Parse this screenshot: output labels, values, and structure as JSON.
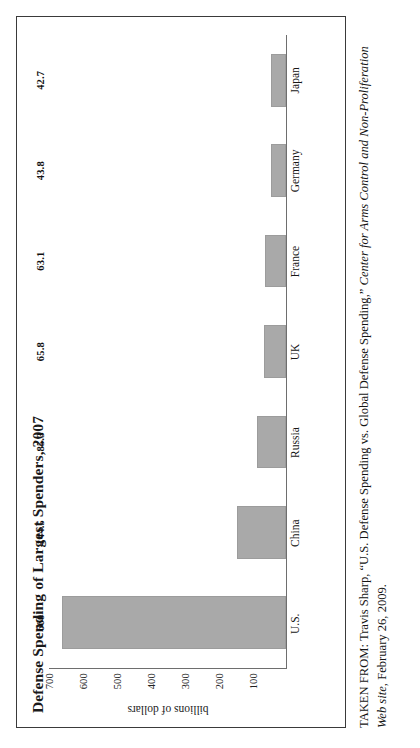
{
  "figure": {
    "title": "Defense Spending of Largest Spenders, 2007"
  },
  "chart_data": {
    "type": "bar",
    "title": "Defense Spending of Largest Spenders, 2007",
    "xlabel": "",
    "ylabel": "billions of dollars",
    "categories": [
      "U.S.",
      "China",
      "Russia",
      "UK",
      "France",
      "Germany",
      "Japan"
    ],
    "values": [
      660,
      144.5,
      85.3,
      65.8,
      63.1,
      43.8,
      42.7
    ],
    "value_labels": [
      "660",
      "144.5",
      "85.3",
      "65.8",
      "63.1",
      "43.8",
      "42.7"
    ],
    "ylim": [
      0,
      700
    ],
    "ytick_labels": [
      "700",
      "600",
      "500",
      "400",
      "300",
      "200",
      "100"
    ],
    "ytick_values": [
      700,
      600,
      500,
      400,
      300,
      200,
      100
    ],
    "grid": false,
    "legend": null,
    "bar_color": "#a9a9a9",
    "axis_color": "#6e6e6e"
  },
  "caption": {
    "lead": "TAKEN FROM: Travis Sharp, “U.S. Defense Spending vs. Global Defense Spending,” ",
    "source_italic": "Center for Arms Control and Non-Proliferation Web site",
    "tail": ", February 26, 2009."
  }
}
